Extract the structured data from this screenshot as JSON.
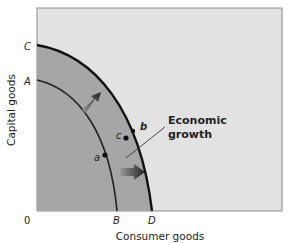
{
  "diagram": {
    "axes": {
      "x_label": "Consumer goods",
      "y_label": "Capital goods",
      "origin": "0"
    },
    "intercepts": {
      "y_inner": "A",
      "y_outer": "C",
      "x_inner": "B",
      "x_outer": "D"
    },
    "points": [
      {
        "label": "a",
        "on": "inner curve"
      },
      {
        "label": "b",
        "on": "outer curve"
      },
      {
        "label": "c",
        "on": "between curves"
      }
    ],
    "annotation": {
      "line1": "Economic",
      "line2": "growth"
    },
    "colors": {
      "plot_background": "#e2e2e2",
      "shaded_region": "#a6a6a6",
      "curve": "#111111",
      "frame": "#8a8a8a"
    }
  }
}
